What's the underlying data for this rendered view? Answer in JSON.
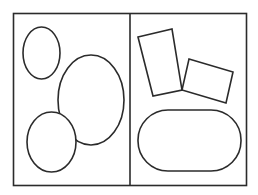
{
  "diagram": {
    "stroke_color": "#2b2b2b",
    "background": "#ffffff",
    "panels": [
      {
        "name": "left-panel",
        "shapes": [
          {
            "type": "ellipse",
            "cx": 41.5,
            "cy": 53,
            "rx": 18.5,
            "ry": 26
          },
          {
            "type": "ellipse",
            "cx": 91,
            "cy": 100,
            "rx": 33,
            "ry": 45
          },
          {
            "type": "ellipse",
            "cx": 51.5,
            "cy": 142,
            "rx": 24.5,
            "ry": 30
          }
        ]
      },
      {
        "name": "right-panel",
        "shapes": [
          {
            "type": "polygon",
            "points": "138,37 172,29 182,90 153,96"
          },
          {
            "type": "polygon",
            "points": "189,59 233,72 226,103 182,90"
          },
          {
            "type": "rounded-rect",
            "x": 138,
            "y": 110,
            "width": 103,
            "height": 61,
            "r": 30
          }
        ]
      }
    ]
  }
}
